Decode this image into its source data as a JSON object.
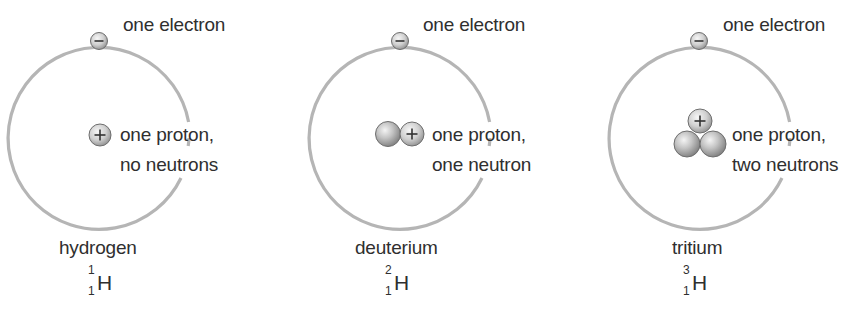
{
  "figure": {
    "colors": {
      "orbit": "#b5b5b5",
      "particle_fill_light": "#f0f0f0",
      "particle_fill_dark": "#8a8a8a",
      "particle_stroke": "#6e6e6e",
      "text": "#2f2f2f"
    },
    "atoms": [
      {
        "name": "hydrogen",
        "electron_label": "one electron",
        "nucleus_label_line1": "one proton,",
        "nucleus_label_line2": "no neutrons",
        "symbol": "H",
        "mass_number": "1",
        "atomic_number": "1",
        "protons": 1,
        "neutrons": 0,
        "electrons": 1
      },
      {
        "name": "deuterium",
        "electron_label": "one electron",
        "nucleus_label_line1": "one proton,",
        "nucleus_label_line2": "one neutron",
        "symbol": "H",
        "mass_number": "2",
        "atomic_number": "1",
        "protons": 1,
        "neutrons": 1,
        "electrons": 1
      },
      {
        "name": "tritium",
        "electron_label": "one electron",
        "nucleus_label_line1": "one proton,",
        "nucleus_label_line2": "two neutrons",
        "symbol": "H",
        "mass_number": "3",
        "atomic_number": "1",
        "protons": 1,
        "neutrons": 2,
        "electrons": 1
      }
    ],
    "particle_glyphs": {
      "electron_sign": "−",
      "proton_sign": "+"
    }
  }
}
